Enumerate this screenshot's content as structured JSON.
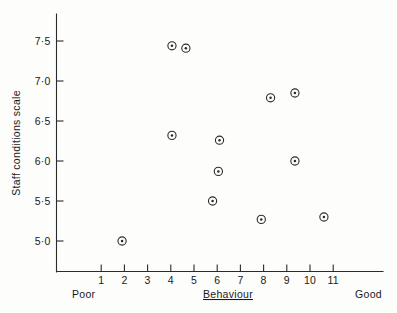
{
  "chart_data": {
    "type": "scatter",
    "title": "",
    "xlabel": "Behaviour",
    "ylabel": "Staff conditions scale",
    "x_endpoint_low_label": "Poor",
    "x_endpoint_high_label": "Good",
    "xlim": [
      0.0,
      12.2
    ],
    "ylim": [
      4.75,
      7.75
    ],
    "xticks": [
      1,
      2,
      3,
      4,
      5,
      6,
      7,
      8,
      9,
      10,
      11
    ],
    "xtick_labels": [
      "1",
      "2",
      "3",
      "4",
      "5",
      "6",
      "7",
      "8",
      "9",
      "10",
      "11"
    ],
    "yticks": [
      5.0,
      5.5,
      6.0,
      6.5,
      7.0,
      7.5
    ],
    "ytick_labels": [
      "5·0",
      "5·5",
      "6·0",
      "6·5",
      "7·0",
      "7·5"
    ],
    "grid": false,
    "legend": null,
    "marker": "circle-with-dot",
    "point_count": 13,
    "points": [
      {
        "x": 1.9,
        "y": 5.0
      },
      {
        "x": 4.05,
        "y": 7.44
      },
      {
        "x": 4.65,
        "y": 7.41
      },
      {
        "x": 4.05,
        "y": 6.32
      },
      {
        "x": 5.8,
        "y": 5.5
      },
      {
        "x": 6.1,
        "y": 6.26
      },
      {
        "x": 6.05,
        "y": 5.87
      },
      {
        "x": 7.9,
        "y": 5.27
      },
      {
        "x": 8.3,
        "y": 6.79
      },
      {
        "x": 9.35,
        "y": 6.85
      },
      {
        "x": 9.35,
        "y": 6.0
      },
      {
        "x": 10.6,
        "y": 5.3
      }
    ]
  },
  "axes": {
    "y_title": "Staff conditions scale",
    "x_title": "Behaviour",
    "x_low": "Poor",
    "x_high": "Good"
  }
}
